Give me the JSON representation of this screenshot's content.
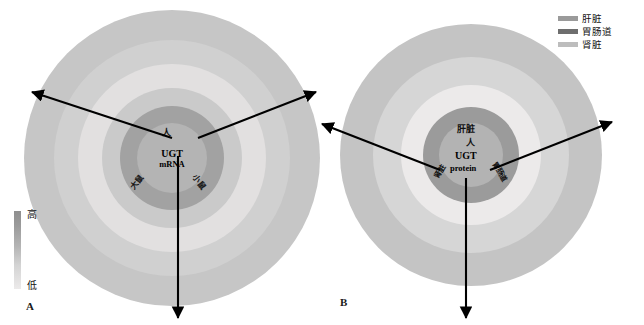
{
  "figure": {
    "panels": [
      {
        "id": "A",
        "letter": "A",
        "center_lines": [
          "人",
          "UGT",
          "mRNA"
        ]
      },
      {
        "id": "B",
        "letter": "B",
        "center_lines": [
          "肝脏",
          "人",
          "UGT",
          "protein"
        ]
      }
    ]
  },
  "scale": {
    "high_label": "高",
    "low_label": "低",
    "high_color": "#8f8f8f",
    "low_color": "#ececec"
  },
  "legend": {
    "items": [
      {
        "label": "肝脏",
        "color": "#9a9a9a"
      },
      {
        "label": "胃肠道",
        "color": "#6e6e6e"
      },
      {
        "label": "肾脏",
        "color": "#bdbdbd"
      }
    ]
  },
  "panel_a": {
    "center": {
      "species_top": "人",
      "title": "UGT",
      "subtitle": "mRNA"
    },
    "species_labels": [
      {
        "name": "人",
        "position": "top"
      },
      {
        "name": "大鼠",
        "position": "lower-left"
      },
      {
        "name": "小鼠",
        "position": "lower-right"
      }
    ],
    "sectors": [
      {
        "name": "human-liver",
        "species": "人",
        "tissue": "肝脏",
        "rings": [
          {
            "ring": "outer",
            "genes": [
              "1A1",
              "1A4",
              "1A8",
              "1A10"
            ]
          },
          {
            "ring": "mid-outer",
            "genes": [
              "2B7",
              "2B15",
              "2B17"
            ]
          },
          {
            "ring": "mid",
            "genes": [
              "1A3",
              "1A5",
              "1A6"
            ]
          },
          {
            "ring": "mid-inner",
            "genes": [
              "1A7",
              "2B11"
            ]
          },
          {
            "ring": "inner",
            "genes": [
              "1A9",
              "2B4",
              "2B10",
              "2B28"
            ]
          }
        ]
      },
      {
        "name": "human-gi",
        "species": "人",
        "tissue": "胃肠道",
        "rings": [
          {
            "ring": "outer",
            "genes": [
              "1A1",
              "1A4",
              "1A9"
            ]
          },
          {
            "ring": "mid-outer",
            "genes": [
              "2B7",
              "2B15",
              "2B4",
              "2B10"
            ]
          },
          {
            "ring": "mid",
            "genes": [
              "1A3",
              "1A6",
              "2B17"
            ]
          },
          {
            "ring": "mid-inner",
            "genes": [
              "2B11"
            ]
          },
          {
            "ring": "inner",
            "genes": [
              "1A5",
              "1A7",
              "1A8",
              "1A10",
              "2B28"
            ]
          }
        ]
      },
      {
        "name": "human-kidney",
        "species": "人",
        "tissue": "肾脏",
        "rings": [
          {
            "ring": "outer",
            "genes": [
              "1A6",
              "1A9"
            ]
          },
          {
            "ring": "mid-outer",
            "genes": [
              "1A5",
              "2B7"
            ]
          },
          {
            "ring": "mid",
            "genes": [
              "1A7",
              "2B4"
            ]
          },
          {
            "ring": "mid-inner",
            "genes": [
              "2B17"
            ]
          },
          {
            "ring": "inner",
            "genes": [
              "1A1",
              "1A3",
              "1A4",
              "1A8"
            ]
          }
        ]
      },
      {
        "name": "mouse-sector",
        "species": "小鼠",
        "rings": [
          {
            "ring": "outer",
            "genes": [
              "1a1",
              "1a6",
              "1a2",
              "1a7c"
            ]
          },
          {
            "ring": "mid-outer",
            "genes": [
              "1a5",
              "1a9",
              "1a8",
              "1a10"
            ]
          },
          {
            "ring": "mid",
            "genes": [
              "1a1",
              "1a9",
              "1a5",
              "1a10",
              "1a8",
              "1a7c"
            ]
          },
          {
            "ring": "inner",
            "genes": [
              "1a5",
              "1a1",
              "1a9",
              "1a6",
              "1a2"
            ]
          }
        ]
      },
      {
        "name": "rat-sector",
        "species": "大鼠",
        "rings": [
          {
            "ring": "outer",
            "genes": [
              "1A1",
              "1A2",
              "1A7",
              "1A5",
              "1A3",
              "1A6"
            ]
          },
          {
            "ring": "mid",
            "genes": [
              "1A6",
              "1A5",
              "1A3",
              "1A1",
              "1A8"
            ]
          },
          {
            "ring": "inner",
            "genes": [
              "1A2",
              "1A7",
              "1A8",
              "1A9"
            ]
          }
        ]
      },
      {
        "name": "rat-outer-left",
        "species": "大鼠",
        "rings": [
          {
            "ring": "outer",
            "genes": [
              "1A1",
              "1A6",
              "1A8",
              "1A5",
              "1A3",
              "1A2",
              "1A7"
            ]
          }
        ]
      },
      {
        "name": "human-left-outer",
        "species": "人",
        "rings": [
          {
            "ring": "outer",
            "genes": [
              "1A1",
              "1A4",
              "1A9"
            ]
          },
          {
            "ring": "mid-outer",
            "genes": [
              "2B7",
              "2B15",
              "2B4",
              "2B10",
              "2B17"
            ]
          },
          {
            "ring": "mid",
            "genes": [
              "1A3",
              "1A6",
              "2B11"
            ]
          },
          {
            "ring": "inner",
            "genes": [
              "1A5",
              "1A7",
              "1A8",
              "1A10",
              "2B28"
            ]
          }
        ]
      }
    ],
    "all_labels_ordered": [
      "1A1",
      "1A4",
      "1A8",
      "1A10",
      "2B7",
      "2B15",
      "2B17",
      "1A3",
      "1A5",
      "1A6",
      "1A7",
      "2B11",
      "1A9",
      "2B4",
      "2B10",
      "2B28",
      "1A6",
      "1A9",
      "1A5",
      "2B7",
      "1A7",
      "2B4",
      "2B17",
      "1a1",
      "1a6",
      "1a5",
      "1a9",
      "1a8",
      "1a10",
      "1a2",
      "1a7c",
      "1A1",
      "1A2",
      "1A7",
      "1A5",
      "1A3",
      "1A6",
      "1A8"
    ]
  },
  "panel_b": {
    "center": {
      "tissue": "肝脏",
      "species": "人",
      "title": "UGT",
      "subtitle": "protein"
    },
    "inner_tissue_labels": [
      "肾脏",
      "胃肠道"
    ],
    "sectors": [
      {
        "name": "liver",
        "tissue": "肝脏",
        "rings": [
          {
            "ring": "inner",
            "genes": [
              "1A5",
              "1A7",
              "1A8",
              "1A10"
            ]
          },
          {
            "ring": "mid",
            "genes": [
              "1A3",
              "1A4",
              "1A6"
            ]
          },
          {
            "ring": "outer",
            "genes": [
              "1A1",
              "1A9"
            ]
          }
        ]
      },
      {
        "name": "gastrointestinal",
        "tissue": "胃肠道",
        "rings": [
          {
            "ring": "inner",
            "genes": [
              "1A3",
              "1A4",
              "1A5",
              "1A10"
            ]
          },
          {
            "ring": "mid",
            "genes": [
              "1A6",
              "1A7",
              "1A9",
              "1A8"
            ]
          },
          {
            "ring": "outer",
            "genes": [
              "1A1"
            ]
          }
        ]
      },
      {
        "name": "kidney",
        "tissue": "肾脏",
        "rings": [
          {
            "ring": "inner",
            "genes": [
              "1A5",
              "1A3",
              "1A1"
            ]
          },
          {
            "ring": "mid",
            "genes": [
              "1A8",
              "1A6",
              "1A4"
            ]
          },
          {
            "ring": "outer",
            "genes": [
              "1A10",
              "1A9",
              "1A7"
            ]
          }
        ]
      }
    ]
  },
  "colors": {
    "ring_outer": "#c9c9c9",
    "ring_3": "#d2d2d2",
    "ring_2": "#e4e2e2",
    "ring_1": "#b6b6b6",
    "ring_core": "#9e9e9e",
    "ring_core_inner": "#b0b0b0",
    "arrow": "#000000",
    "divider": "#ffffff"
  }
}
